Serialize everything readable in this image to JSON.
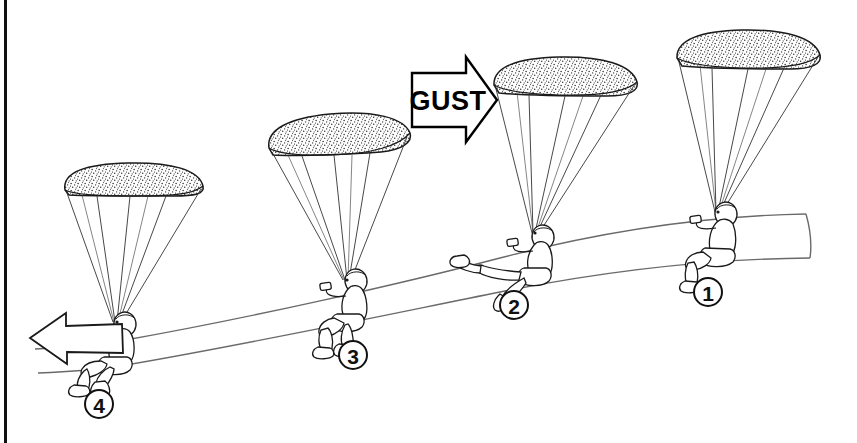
{
  "figure": {
    "background_color": "#ffffff",
    "ink_color": "#111111",
    "line_color": "#555555",
    "border": {
      "side": "left",
      "color": "#111111",
      "x": 5
    }
  },
  "annotations": {
    "gust_arrow": {
      "label": "GUST",
      "direction": "right",
      "x": 455,
      "y": 100
    },
    "travel_arrow": {
      "label": "",
      "direction": "left",
      "tip_x": 30,
      "tip_y": 338
    }
  },
  "markers": [
    {
      "label": "1",
      "cx": 708,
      "cy": 292,
      "r": 14
    },
    {
      "label": "2",
      "cx": 514,
      "cy": 305,
      "r": 14
    },
    {
      "label": "3",
      "cx": 353,
      "cy": 355,
      "r": 14
    },
    {
      "label": "4",
      "cx": 99,
      "cy": 404,
      "r": 14
    }
  ],
  "positions": [
    {
      "id": "1",
      "name": "position-1-normal-flight",
      "canopy_tilt": "level-right",
      "pilot_pose": "seated-upright",
      "canopy": {
        "left_x": 675,
        "right_x": 820,
        "top_y": 30,
        "bottom_y": 68
      },
      "pilot": {
        "x": 716,
        "y": 228
      }
    },
    {
      "id": "2",
      "name": "position-2-gust-hit",
      "canopy_tilt": "level",
      "pilot_pose": "legs-extended-forward-swinging-back",
      "canopy": {
        "left_x": 492,
        "right_x": 637,
        "top_y": 58,
        "bottom_y": 96
      },
      "pilot": {
        "x": 533,
        "y": 248
      }
    },
    {
      "id": "3",
      "name": "position-3-pendulum-swing",
      "canopy_tilt": "tilted-left",
      "pilot_pose": "seated-legs-tucked",
      "canopy": {
        "left_x": 268,
        "right_x": 410,
        "top_y": 113,
        "bottom_y": 155
      },
      "pilot": {
        "x": 357,
        "y": 295
      }
    },
    {
      "id": "4",
      "name": "position-4-recovery",
      "canopy_tilt": "level-right",
      "pilot_pose": "seated-legs-forward",
      "canopy": {
        "left_x": 63,
        "right_x": 203,
        "top_y": 163,
        "bottom_y": 196
      },
      "pilot": {
        "x": 110,
        "y": 337
      }
    }
  ],
  "flight_path": {
    "name": "flight-path-ribbon",
    "description": "two parallel curves forming a descending ribbon from right to left",
    "start_x": 810,
    "end_x": 30
  }
}
